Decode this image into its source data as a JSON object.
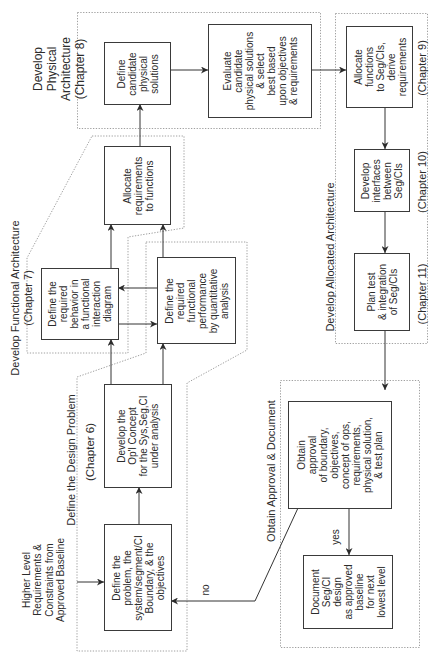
{
  "diagram": {
    "regions": {
      "physical_architecture": {
        "label": "Develop\nPhysical\nArchitecture\n(Chapter 8)"
      },
      "functional_architecture": {
        "label": "Develop Functional Architecture\n(Chapter 7)"
      },
      "design_problem": {
        "label": "Define the Design Problem",
        "chapter": "(Chapter 6)"
      },
      "allocated_architecture": {
        "label": "Develop Allocated Architecture",
        "chapter_9": "(Chapter 9)",
        "chapter_10": "(Chapter 10)",
        "chapter_11": "(Chapter 11)"
      },
      "approval": {
        "label": "Obtain Approval & Document"
      }
    },
    "input_note": "Higher Level\nRequirements &\nConstraints from\nApproved Baseline",
    "boxes": {
      "define_candidate": "Define\ncandidate\nphysical\nsolutions",
      "evaluate": "Evaluate\ncandidate\nphysical solutions\n& select\nbest based\nupon objectives\n& requirements",
      "allocate_functions": "Allocate\nfunctions\nto Seg/CIs,\nderive\nrequirements",
      "develop_interfaces": "Develop\ninterfaces\nbetween\nSeg/CIs",
      "plan_test": "Plan test\n& integration\nof Seg/CIs",
      "allocate_requirements": "Allocate\nrequirements\nto functions",
      "define_behavior": "Define the\nrequired\nbehavior in\na functional\ninteraction\ndiagram",
      "define_performance": "Define the\nrequired\nfunctional\nperformance\nby quantitative\nanalysis",
      "develop_opl_concept": "Develop the\nOp'l Concept\nfor the Sys,Seg,CI\nunder analysis",
      "define_problem": "Define the\nproblem, the\nsystem/segment/CI\nBoundary, & the\nobjectives",
      "obtain_approval": "Obtain\napproval\nof boundary,\nobjectives,\nconcept of ops,\nrequirements,\nphysical solution,\n& test plan",
      "document": "Document\nSeg/CI\ndesign\nas approved\nbaseline\nfor next\nlowest level"
    },
    "edge_labels": {
      "yes": "yes",
      "no": "no"
    },
    "edges": [
      {
        "from": "input_note",
        "to": "define_problem"
      },
      {
        "from": "define_problem",
        "to": "develop_opl_concept"
      },
      {
        "from": "develop_opl_concept",
        "to": "define_behavior"
      },
      {
        "from": "develop_opl_concept",
        "to": "define_performance"
      },
      {
        "from": "define_performance",
        "to": "define_behavior"
      },
      {
        "from": "define_behavior",
        "to": "define_performance"
      },
      {
        "from": "define_behavior",
        "to": "allocate_requirements"
      },
      {
        "from": "define_performance",
        "to": "allocate_requirements"
      },
      {
        "from": "allocate_requirements",
        "to": "define_candidate"
      },
      {
        "from": "define_candidate",
        "to": "evaluate"
      },
      {
        "from": "evaluate",
        "to": "allocate_functions"
      },
      {
        "from": "allocate_functions",
        "to": "develop_interfaces"
      },
      {
        "from": "develop_interfaces",
        "to": "plan_test"
      },
      {
        "from": "plan_test",
        "to": "obtain_approval"
      },
      {
        "from": "obtain_approval",
        "to": "document",
        "label": "yes"
      },
      {
        "from": "obtain_approval",
        "to": "define_problem",
        "label": "no"
      }
    ],
    "colors": {
      "background": "#ffffff",
      "line": "#333333",
      "box_border": "#3a3a3a",
      "region_boundary": "#a0a0a0",
      "text": "#2b2b2b"
    }
  }
}
